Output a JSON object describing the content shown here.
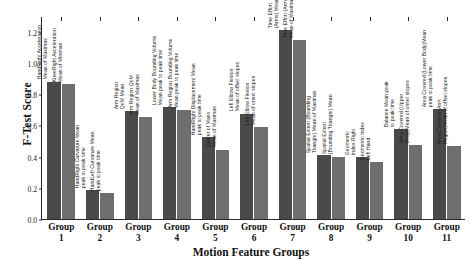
{
  "chart_data": {
    "type": "bar",
    "title": "",
    "xlabel": "Motion Feature Groups",
    "ylabel": "F-Test Score",
    "ylim": [
      0.0,
      1.3
    ],
    "yticks": [
      "0.0",
      "0.2",
      "0.4",
      "0.6",
      "0.8",
      "1.0",
      "1.2"
    ],
    "ytick_values": [
      0.0,
      0.2,
      0.4,
      0.6,
      0.8,
      1.0,
      1.2
    ],
    "grid": false,
    "legend": "none",
    "categories": [
      "Group\n1",
      "Group\n2",
      "Group\n3",
      "Group\n4",
      "Group\n5",
      "Group\n6",
      "Group\n7",
      "Group\n8",
      "Group\n9",
      "Group\n10",
      "Group\n11"
    ],
    "category_lines": [
      [
        "Group",
        "1"
      ],
      [
        "Group",
        "2"
      ],
      [
        "Group",
        "3"
      ],
      [
        "Group",
        "4"
      ],
      [
        "Group",
        "5"
      ],
      [
        "Group",
        "6"
      ],
      [
        "Group",
        "7"
      ],
      [
        "Group",
        "8"
      ],
      [
        "Group",
        "9"
      ],
      [
        "Group",
        "10"
      ],
      [
        "Group",
        "11"
      ]
    ],
    "series": [
      {
        "name": "feature-a",
        "color": "#4a4a4a",
        "values": [
          0.88,
          0.185,
          0.69,
          0.715,
          0.525,
          0.675,
          1.21,
          0.41,
          0.395,
          0.575,
          0.705
        ]
      },
      {
        "name": "feature-b",
        "color": "#6e6e6e",
        "values": [
          0.865,
          0.165,
          0.655,
          0.695,
          0.445,
          0.59,
          1.145,
          0.4,
          0.365,
          0.475,
          0.465
        ]
      }
    ],
    "bar_labels": [
      [
        [
          "HandRight Acceleration",
          "Mean of Maximas"
        ],
        [
          "KneeRight Acceleration",
          "Mean of Minimas"
        ]
      ],
      [
        [
          "HandRight Curvature Mean",
          "peak to peak time"
        ],
        [
          "HandLeft Curvature Mean",
          "peak to peak time"
        ]
      ],
      [
        [
          "Arm Region",
          "QoM Mean"
        ],
        [
          "Arm Region QoM",
          "Mean of Maximas"
        ]
      ],
      [
        [
          "Lower Body Bounding Volume",
          "Mean peak to peak time"
        ],
        [
          "Arm Region Bounding Volume",
          "Mean peak to peak time"
        ]
      ],
      [
        [
          "HandRight Displacement Mean",
          "peak to peak time"
        ],
        [
          "Center of Mass",
          "Mean of Maximas"
        ]
      ],
      [
        [
          "Left Elbow Flexion",
          "Mean of offset slopes"
        ],
        [
          "Left Elbow Flexion",
          "Mean of onset slopes"
        ]
      ],
      [
        [
          "Time Effort",
          "(Arms) Mean"
        ],
        [
          "Time Effort (Arms)",
          "Mean of Maximas"
        ]
      ],
      [
        [
          "Spatial Extent (Bounding",
          "Triangle) Mean of Maximas"
        ],
        [
          "Spatial Extent",
          "(Bounding Triangle) Mean"
        ]
      ],
      [
        [
          "Geometric",
          "Index Right"
        ],
        [
          "Geometric Index",
          "Left Hand"
        ]
      ],
      [
        [
          "Balance Mean peak",
          "to peak time"
        ],
        [
          "Area Covered (Upper",
          "Body)Mean of onset slopes"
        ]
      ],
      [
        [
          "Area Covered (Lower Body)Mean",
          "peak to peak time"
        ],
        [
          "Area Covered (Arm",
          "Region)Mean of offset slopes"
        ]
      ]
    ]
  }
}
